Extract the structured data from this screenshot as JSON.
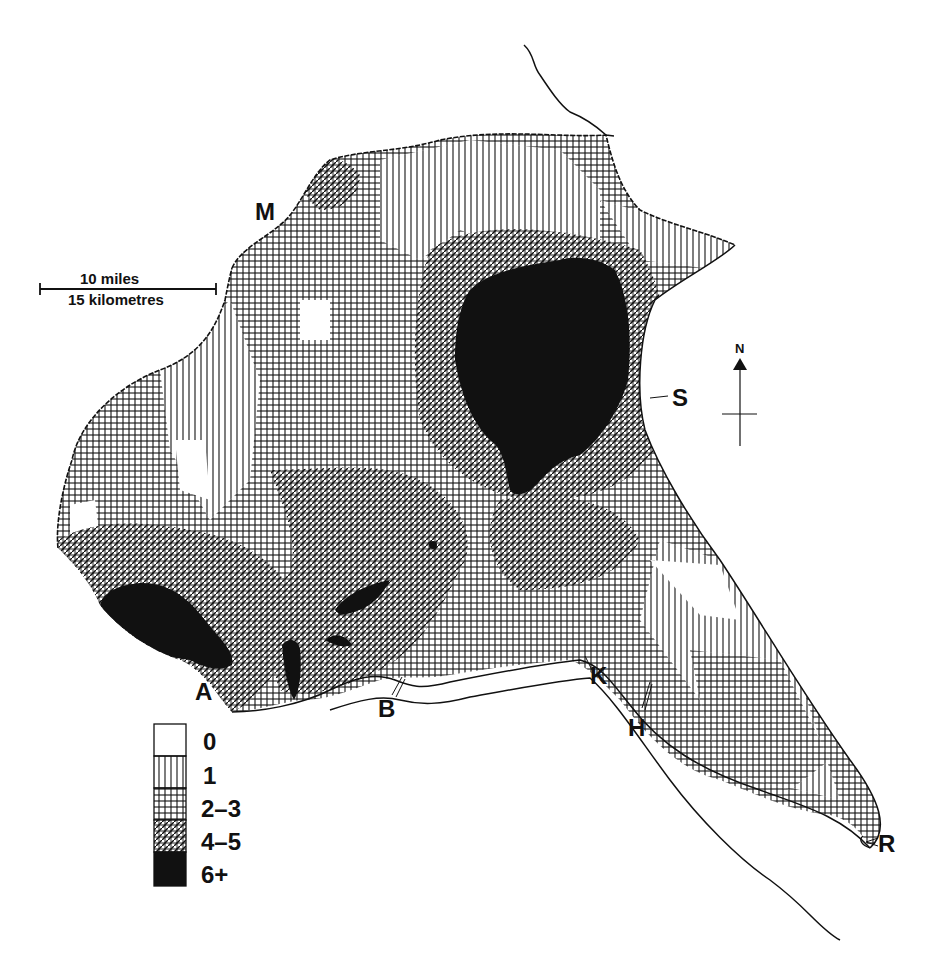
{
  "map": {
    "type": "choropleth-hatch",
    "subject": "Regional density map with hatched classes",
    "legend": {
      "classes": [
        {
          "label": "0",
          "pattern": "blank"
        },
        {
          "label": "1",
          "pattern": "vertical-lines"
        },
        {
          "label": "2–3",
          "pattern": "grid"
        },
        {
          "label": "4–5",
          "pattern": "diagonal-crosshatch"
        },
        {
          "label": "6+",
          "pattern": "solid-black"
        }
      ]
    },
    "scale_bar": {
      "top_label": "10 miles",
      "bottom_label": "15 kilometres"
    },
    "north_arrow": {
      "label": "N"
    },
    "places": [
      {
        "code": "M",
        "x": 268,
        "y": 213
      },
      {
        "code": "S",
        "x": 672,
        "y": 397
      },
      {
        "code": "A",
        "x": 206,
        "y": 692
      },
      {
        "code": "B",
        "x": 387,
        "y": 708
      },
      {
        "code": "K",
        "x": 597,
        "y": 676
      },
      {
        "code": "H",
        "x": 638,
        "y": 728
      },
      {
        "code": "R",
        "x": 884,
        "y": 843
      }
    ],
    "colors": {
      "ink": "#111111",
      "paper": "#ffffff"
    }
  }
}
